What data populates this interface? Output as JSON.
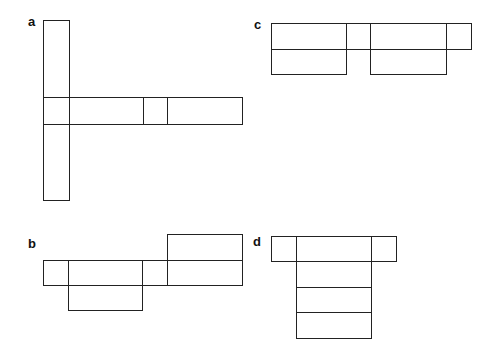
{
  "figures": [
    {
      "label": "a",
      "label_pos": [
        28,
        15
      ],
      "description": "Cross-shaped net: tall vertical column with horizontal strip through its middle",
      "cells": [
        [
          43,
          20,
          26,
          77
        ],
        [
          43,
          97,
          26,
          27
        ],
        [
          43,
          124,
          26,
          76
        ],
        [
          69,
          97,
          74,
          27
        ],
        [
          143,
          97,
          24,
          27
        ],
        [
          167,
          97,
          75,
          27
        ]
      ]
    },
    {
      "label": "b",
      "label_pos": [
        28,
        237
      ],
      "description": "Net with middle strip, a box above right end and a box below second segment",
      "cells": [
        [
          167,
          234,
          75,
          26
        ],
        [
          43,
          260,
          25,
          25
        ],
        [
          68,
          260,
          74,
          25
        ],
        [
          142,
          260,
          25,
          25
        ],
        [
          167,
          260,
          75,
          25
        ],
        [
          68,
          285,
          74,
          25
        ]
      ]
    },
    {
      "label": "c",
      "label_pos": [
        254,
        18
      ],
      "description": "Net with top strip of four segments and two boxes below",
      "cells": [
        [
          271,
          23,
          75,
          26
        ],
        [
          346,
          23,
          24,
          26
        ],
        [
          370,
          23,
          76,
          26
        ],
        [
          446,
          23,
          25,
          26
        ],
        [
          271,
          49,
          75,
          25
        ],
        [
          370,
          49,
          76,
          25
        ]
      ]
    },
    {
      "label": "d",
      "label_pos": [
        253,
        235
      ],
      "description": "Net with top strip of three segments and a column of three boxes below the middle",
      "cells": [
        [
          271,
          236,
          25,
          25
        ],
        [
          296,
          236,
          75,
          25
        ],
        [
          371,
          236,
          25,
          25
        ],
        [
          296,
          261,
          75,
          26
        ],
        [
          296,
          287,
          75,
          25
        ],
        [
          296,
          312,
          75,
          26
        ]
      ]
    }
  ]
}
